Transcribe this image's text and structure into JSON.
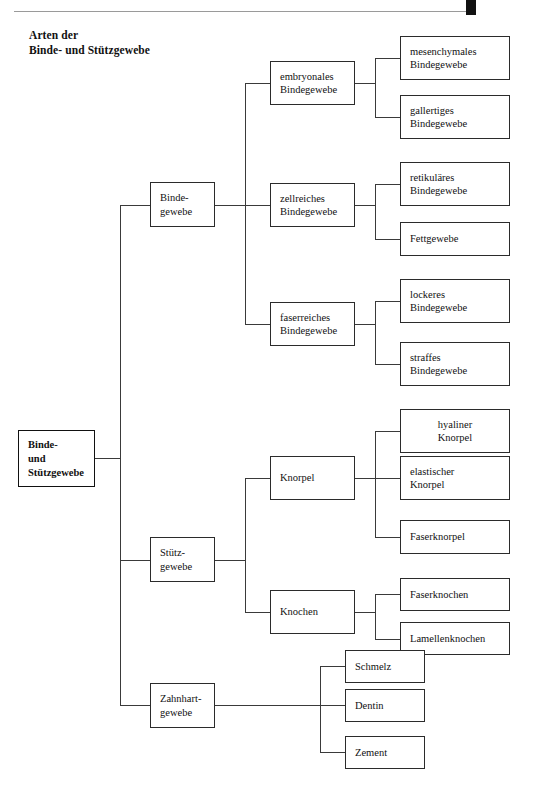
{
  "document": {
    "title_line1": "Arten der",
    "title_line2": "Binde- und Stützgewebe",
    "thumb_tab": "page-thumb-index-marker",
    "rule": "header-rule"
  },
  "diagram": {
    "type": "tree",
    "orientation": "left-to-right",
    "levels": 4,
    "root": {
      "label": "Binde-\nund\nStützgewebe",
      "bold": true
    },
    "level2": [
      {
        "label": "Binde-\ngewebe"
      },
      {
        "label": "Stütz-\ngewebe"
      },
      {
        "label": "Zahnhart-\ngewebe"
      }
    ],
    "level3": [
      {
        "label": "embryonales\nBindegewebe"
      },
      {
        "label": "zellreiches\nBindegewebe"
      },
      {
        "label": "faserreiches\nBindegewebe"
      },
      {
        "label": "Knorpel"
      },
      {
        "label": "Knochen"
      }
    ],
    "level4": [
      {
        "label": "mesenchymales\nBindegewebe"
      },
      {
        "label": "gallertiges\nBindegewebe"
      },
      {
        "label": "retikuläres\nBindegewebe"
      },
      {
        "label": "Fettgewebe"
      },
      {
        "label": "lockeres\nBindegewebe"
      },
      {
        "label": "straffes\nBindegewebe"
      },
      {
        "label": "hyaliner\nKnorpel"
      },
      {
        "label": "elastischer\nKnorpel"
      },
      {
        "label": "Faserknorpel"
      },
      {
        "label": "Faserknochen"
      },
      {
        "label": "Lamellenknochen"
      },
      {
        "label": "Schmelz"
      },
      {
        "label": "Dentin"
      },
      {
        "label": "Zement"
      }
    ],
    "colors": {
      "box_border": "#2b2b2b",
      "line": "#3a3a3a",
      "text": "#111111",
      "background": "#ffffff",
      "tab": "#111111"
    }
  }
}
